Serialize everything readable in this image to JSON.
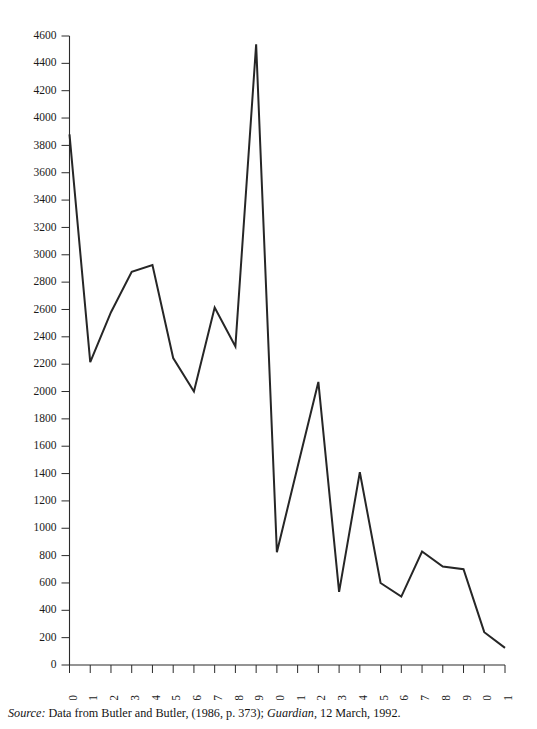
{
  "chart_data": {
    "type": "line",
    "title": "",
    "subtitle": "",
    "xlabel": "",
    "ylabel": "",
    "categories": [
      "1970",
      "1971",
      "1972",
      "1973",
      "1974",
      "1975",
      "1976",
      "1977",
      "1978",
      "1979",
      "1980",
      "1981",
      "1982",
      "1983",
      "1984",
      "1985",
      "1986",
      "1987",
      "1988",
      "1989",
      "1990",
      "1991"
    ],
    "values": [
      3880,
      2215,
      2580,
      2875,
      2925,
      2245,
      2000,
      2615,
      2330,
      4540,
      825,
      1450,
      2070,
      535,
      1410,
      600,
      500,
      830,
      720,
      700,
      240,
      125
    ],
    "x": [
      1970,
      1971,
      1972,
      1973,
      1974,
      1975,
      1976,
      1977,
      1978,
      1979,
      1980,
      1981,
      1982,
      1983,
      1984,
      1985,
      1986,
      1987,
      1988,
      1989,
      1990,
      1991
    ],
    "xlim": [
      1970,
      1991
    ],
    "ylim": [
      0,
      4600
    ],
    "ytick_step": 200,
    "yticks": [
      0,
      200,
      400,
      600,
      800,
      1000,
      1200,
      1400,
      1600,
      1800,
      2000,
      2200,
      2400,
      2600,
      2800,
      3000,
      3200,
      3400,
      3600,
      3800,
      4000,
      4200,
      4400,
      4600
    ],
    "ytick_labels": [
      "0",
      "200",
      "400",
      "600",
      "800",
      "1000",
      "1200",
      "1400",
      "1600",
      "1800",
      "2000",
      "2200",
      "2400",
      "2600",
      "2800",
      "3000",
      "3200",
      "3400",
      "3600",
      "3800",
      "4000",
      "4200",
      "4400",
      "4600"
    ],
    "xtick_labels": [
      "1970",
      "1971",
      "1972",
      "1973",
      "1974",
      "1975",
      "1976",
      "1977",
      "1978",
      "1979",
      "1980",
      "1981",
      "1982",
      "1983",
      "1984",
      "1985",
      "1986",
      "1987",
      "1988",
      "1989",
      "1990",
      "1991"
    ],
    "grid": false,
    "legend": false,
    "legend_position": "none",
    "series": [
      {
        "name": "",
        "values": [
          3880,
          2215,
          2580,
          2875,
          2925,
          2245,
          2000,
          2615,
          2330,
          4540,
          825,
          1450,
          2070,
          535,
          1410,
          600,
          500,
          830,
          720,
          700,
          240,
          125
        ],
        "color": "#262626"
      }
    ],
    "line_color": "#262626",
    "axis_color": "#2b2b2b",
    "background_color": "#ffffff"
  },
  "caption": {
    "source_word": "Source:",
    "text_before_pub": " Data from Butler and Butler, (1986, p. 373); ",
    "publication": "Guardian",
    "text_after_pub": ", 12 March, 1992."
  }
}
